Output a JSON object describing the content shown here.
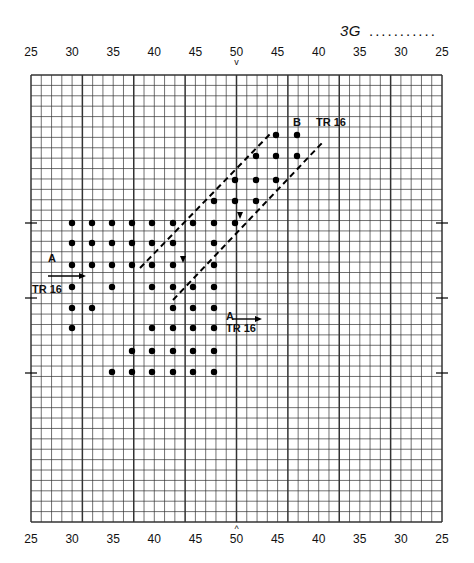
{
  "header": {
    "code": "3G",
    "filler": "..........."
  },
  "axis_labels": {
    "top": [
      "25",
      "30",
      "35",
      "40",
      "45",
      "50",
      "45",
      "40",
      "35",
      "30",
      "25"
    ],
    "bottom": [
      "25",
      "30",
      "35",
      "40",
      "45",
      "50",
      "45",
      "40",
      "35",
      "30",
      "25"
    ],
    "center_marker_top": "v",
    "center_marker_bottom": "^"
  },
  "grid": {
    "left": 31,
    "right": 442,
    "top": 75,
    "bottom": 522,
    "columns": 40,
    "rows": 43,
    "major_every": 5,
    "line_color": "#333333"
  },
  "labels": {
    "section_a_left": "A",
    "tr_left": "TR 16",
    "section_a_right": "A",
    "tr_right": "TR 16",
    "section_b": "B",
    "tr_b": "TR 16"
  },
  "dots": [
    [
      276,
      135
    ],
    [
      297,
      135
    ],
    [
      256,
      156
    ],
    [
      276,
      156
    ],
    [
      297,
      156
    ],
    [
      235,
      180
    ],
    [
      256,
      180
    ],
    [
      276,
      180
    ],
    [
      214,
      201
    ],
    [
      235,
      201
    ],
    [
      256,
      201
    ],
    [
      72,
      223
    ],
    [
      92,
      223
    ],
    [
      112,
      223
    ],
    [
      132,
      223
    ],
    [
      152,
      223
    ],
    [
      173,
      223
    ],
    [
      193,
      223
    ],
    [
      214,
      223
    ],
    [
      235,
      223
    ],
    [
      72,
      243
    ],
    [
      92,
      243
    ],
    [
      112,
      243
    ],
    [
      132,
      243
    ],
    [
      152,
      243
    ],
    [
      173,
      243
    ],
    [
      214,
      243
    ],
    [
      72,
      265
    ],
    [
      92,
      265
    ],
    [
      112,
      265
    ],
    [
      132,
      265
    ],
    [
      152,
      265
    ],
    [
      173,
      265
    ],
    [
      214,
      265
    ],
    [
      72,
      287
    ],
    [
      112,
      287
    ],
    [
      152,
      287
    ],
    [
      173,
      287
    ],
    [
      193,
      287
    ],
    [
      214,
      287
    ],
    [
      72,
      308
    ],
    [
      92,
      308
    ],
    [
      173,
      308
    ],
    [
      193,
      308
    ],
    [
      214,
      308
    ],
    [
      72,
      328
    ],
    [
      152,
      328
    ],
    [
      173,
      328
    ],
    [
      193,
      328
    ],
    [
      214,
      328
    ],
    [
      132,
      351
    ],
    [
      152,
      351
    ],
    [
      173,
      351
    ],
    [
      193,
      351
    ],
    [
      214,
      351
    ],
    [
      112,
      372
    ],
    [
      132,
      372
    ],
    [
      152,
      372
    ],
    [
      173,
      372
    ],
    [
      193,
      372
    ],
    [
      214,
      372
    ]
  ],
  "dashed_lines": [
    {
      "x1": 140,
      "y1": 268,
      "x2": 272,
      "y2": 132
    },
    {
      "x1": 173,
      "y1": 300,
      "x2": 322,
      "y2": 143
    }
  ],
  "arrows": [
    {
      "x1": 48,
      "y1": 276,
      "x2": 86,
      "y2": 276
    },
    {
      "x1": 232,
      "y1": 319,
      "x2": 262,
      "y2": 319
    }
  ],
  "small_down_arrows": [
    [
      183,
      260
    ],
    [
      240,
      216
    ]
  ]
}
